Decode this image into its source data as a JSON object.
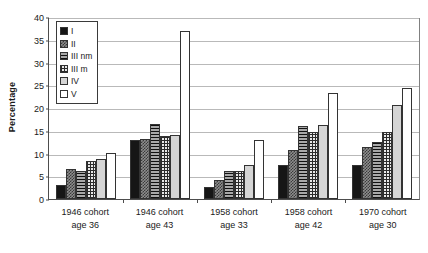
{
  "chart_data": {
    "type": "bar",
    "title": "",
    "subtitle": "",
    "xlabel": "",
    "ylabel": "Percentage",
    "ylim": [
      0,
      40
    ],
    "ytick_step": 5,
    "yticks": [
      0,
      5,
      10,
      15,
      20,
      25,
      30,
      35,
      40
    ],
    "grid": true,
    "legend_position": "top-left-inside",
    "categories": [
      "1946 cohort age 36",
      "1946 cohort age 43",
      "1958 cohort age 33",
      "1958 cohort age 42",
      "1970 cohort age 30"
    ],
    "category_lines": [
      [
        "1946 cohort",
        "age 36"
      ],
      [
        "1946 cohort",
        "age 43"
      ],
      [
        "1958 cohort",
        "age 33"
      ],
      [
        "1958 cohort",
        "age 42"
      ],
      [
        "1970 cohort",
        "age 30"
      ]
    ],
    "series": [
      {
        "name": "I",
        "pattern": "solid-black",
        "values": [
          3.0,
          12.9,
          2.6,
          7.4,
          7.4
        ]
      },
      {
        "name": "II",
        "pattern": "fine-checker",
        "values": [
          6.5,
          13.3,
          4.1,
          10.7,
          11.4
        ]
      },
      {
        "name": "III nm",
        "pattern": "horizontal-hatch",
        "values": [
          6.2,
          16.5,
          6.2,
          16.1,
          12.5
        ]
      },
      {
        "name": "III m",
        "pattern": "crosshatch-grid",
        "values": [
          8.3,
          13.9,
          6.1,
          14.8,
          14.7
        ]
      },
      {
        "name": "IV",
        "pattern": "light-gray",
        "values": [
          8.8,
          14.0,
          7.4,
          16.3,
          20.7
        ]
      },
      {
        "name": "V",
        "pattern": "white",
        "values": [
          10.2,
          37.0,
          12.9,
          23.2,
          24.5
        ]
      }
    ]
  },
  "legend": {
    "items": [
      {
        "label": "I"
      },
      {
        "label": "II"
      },
      {
        "label": "III nm"
      },
      {
        "label": "III m"
      },
      {
        "label": "IV"
      },
      {
        "label": "V"
      }
    ]
  },
  "colors": {
    "axis": "#4d4d4d",
    "grid": "#b9b9b9",
    "text": "#1a1a1a",
    "bar_outline": "#333333",
    "background": "#ffffff"
  }
}
